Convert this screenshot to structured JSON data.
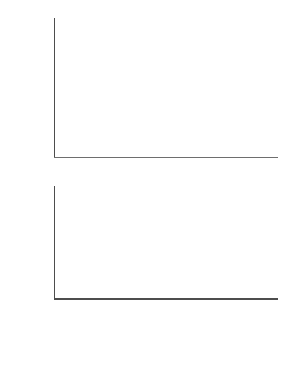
{
  "chart_data": [
    {
      "type": "bar",
      "panel": "top",
      "title": "",
      "xlabel": "plaque area (arbitrary units)",
      "ylabel": "frequencies",
      "grid": false,
      "legend": false,
      "ylim": [
        0,
        52
      ],
      "xlim": [
        2.5,
        82.5
      ],
      "yticks": [
        10,
        20,
        30,
        40,
        50
      ],
      "ytick_labels": [
        "10",
        "20",
        "30",
        "40",
        "50"
      ],
      "xticks": [
        5,
        20,
        40,
        60,
        80
      ],
      "xtick_labels": [
        "5",
        "20",
        "40",
        "60",
        "80"
      ],
      "bin_width": 5,
      "bin_centers": [
        5,
        10,
        15,
        20,
        25
      ],
      "categories": [
        "5",
        "10",
        "15",
        "20",
        "25"
      ],
      "values": [
        47,
        41,
        9,
        2,
        1
      ],
      "bar_color": "#000000"
    },
    {
      "type": "bar",
      "panel": "bottom",
      "title": "",
      "xlabel": "plaque area (arbitrary units)",
      "ylabel": "frequencies",
      "grid": false,
      "legend": false,
      "ylim": [
        0,
        52
      ],
      "xlim": [
        2.5,
        82.5
      ],
      "yticks": [
        10,
        20,
        30,
        40,
        50
      ],
      "ytick_labels": [
        "10",
        "20",
        "30",
        "40",
        "50"
      ],
      "xticks": [
        5,
        20,
        40,
        60,
        80
      ],
      "xtick_labels": [
        "5",
        "20",
        "40",
        "60",
        "80"
      ],
      "bin_width": 5,
      "bin_centers": [
        5,
        10,
        15,
        20,
        25,
        30,
        35,
        40,
        45,
        50,
        55,
        60,
        65,
        70,
        75,
        80
      ],
      "categories": [
        "5",
        "10",
        "15",
        "20",
        "25",
        "30",
        "35",
        "40",
        "45",
        "50",
        "55",
        "60",
        "65",
        "70",
        "75",
        "80"
      ],
      "values": [
        3,
        16,
        16,
        13,
        11,
        9.5,
        7.5,
        6.5,
        6.5,
        5.5,
        5.5,
        4.5,
        4.5,
        4.5,
        4.5,
        2
      ],
      "bar_color": "#000000"
    }
  ],
  "axes": {
    "ylabel": "frequencies",
    "xlabel": "plaque area (arbitrary units)",
    "axis_color": "#4d4d4d"
  }
}
